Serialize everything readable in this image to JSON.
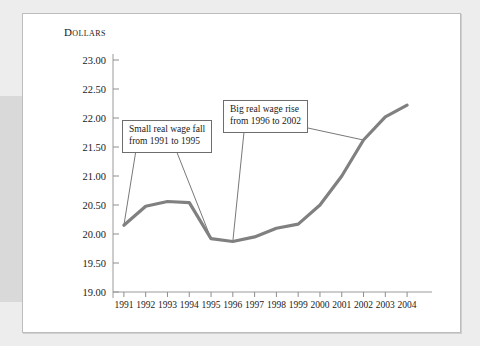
{
  "figure": {
    "background_color": "#ededed",
    "panel_color": "#ffffff",
    "frame_color": "#bdbdbd",
    "band_color": "#d9d9d9"
  },
  "chart_data": {
    "type": "line",
    "title": "",
    "ylabel": "Dollars",
    "xlabel": "",
    "ylim": [
      19.0,
      23.0
    ],
    "ytick_step": 0.5,
    "grid": false,
    "legend": "none",
    "line_color": "#808080",
    "line_width": 3.2,
    "ytick_labels": [
      "23.00",
      "22.50",
      "22.00",
      "21.50",
      "21.00",
      "20.50",
      "20.00",
      "19.50",
      "19.00"
    ],
    "ytick_values": [
      23.0,
      22.5,
      22.0,
      21.5,
      21.0,
      20.5,
      20.0,
      19.5,
      19.0
    ],
    "categories": [
      "1991",
      "1992",
      "1993",
      "1994",
      "1995",
      "1996",
      "1997",
      "1998",
      "1999",
      "2000",
      "2001",
      "2002",
      "2003",
      "2004"
    ],
    "x": [
      1991,
      1992,
      1993,
      1994,
      1995,
      1996,
      1997,
      1998,
      1999,
      2000,
      2001,
      2002,
      2003,
      2004
    ],
    "values": [
      20.15,
      20.48,
      20.56,
      20.54,
      19.92,
      19.87,
      19.95,
      20.1,
      20.17,
      20.5,
      21.0,
      21.62,
      22.02,
      22.22
    ],
    "series": [
      {
        "name": "Real wage",
        "values": [
          20.15,
          20.48,
          20.56,
          20.54,
          19.92,
          19.87,
          19.95,
          20.1,
          20.17,
          20.5,
          21.0,
          21.62,
          22.02,
          22.22
        ]
      }
    ],
    "annotations": [
      {
        "id": "callout-1",
        "text": "Small real wage fall\nfrom 1991 to 1995",
        "points_to": [
          "1991",
          "1995"
        ]
      },
      {
        "id": "callout-2",
        "text": "Big real wage rise\nfrom 1996 to 2002",
        "points_to": [
          "1996",
          "2002"
        ]
      }
    ]
  },
  "annotation_1": {
    "text": "Small real wage fall\nfrom 1991 to 1995"
  },
  "annotation_2": {
    "text": "Big real wage rise\nfrom 1996 to 2002"
  },
  "axis": {
    "y_title": "Dollars"
  }
}
